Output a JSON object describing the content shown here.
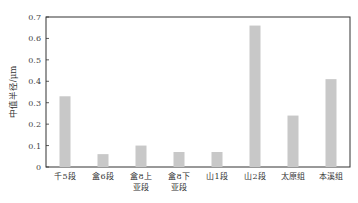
{
  "chart_data": {
    "type": "bar",
    "title": "",
    "xlabel": "",
    "ylabel": "中值半径/μm",
    "ylim": [
      0,
      0.7
    ],
    "yticks": [
      "0",
      "0.1",
      "0.2",
      "0.3",
      "0.4",
      "0.5",
      "0.6",
      "0.7"
    ],
    "categories": [
      [
        "千5段"
      ],
      [
        "盒6段"
      ],
      [
        "盒8上",
        "亚段"
      ],
      [
        "盒8下",
        "亚段"
      ],
      [
        "山1段"
      ],
      [
        "山2段"
      ],
      [
        "太原组"
      ],
      [
        "本溪组"
      ]
    ],
    "values": [
      0.33,
      0.06,
      0.1,
      0.07,
      0.07,
      0.66,
      0.24,
      0.41
    ],
    "bar_color": "#c8c8c8",
    "grid": false,
    "legend": null
  }
}
